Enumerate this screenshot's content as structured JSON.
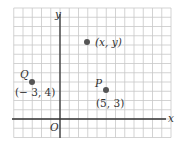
{
  "diagram": {
    "type": "coordinate-plane",
    "grid": {
      "origin_px": [
        60,
        119
      ],
      "cell_px": 9.25,
      "x_range": [
        -5,
        12
      ],
      "y_range": [
        -2,
        12
      ],
      "grid_color": "#c8c8c8",
      "axis_color": "#333333"
    },
    "axes": {
      "x_label": "x",
      "y_label": "y",
      "origin_label": "O"
    },
    "points": [
      {
        "name": "Q",
        "coords": [
          -3,
          4
        ],
        "coord_label": "(− 3, 4)",
        "name_label": "Q"
      },
      {
        "name": "P",
        "coords": [
          5,
          3
        ],
        "coord_label": "(5, 3)",
        "name_label": "P"
      },
      {
        "name": "general",
        "coords": [
          3,
          8.4
        ],
        "coord_label": "(x, y)",
        "name_label": ""
      }
    ],
    "point_color": "#555555"
  }
}
